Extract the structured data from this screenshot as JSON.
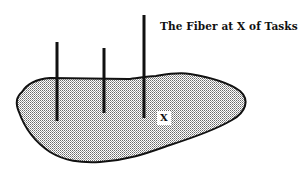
{
  "diagram": {
    "title": "The Fiber at X of Tasks",
    "point_label": "X",
    "colors": {
      "outline": "#111111",
      "fill_dots": "#555555",
      "background": "#ffffff"
    },
    "fibers": [
      {
        "x": 57,
        "y_top": 42,
        "y_bottom": 121
      },
      {
        "x": 104,
        "y_top": 48,
        "y_bottom": 113
      },
      {
        "x": 144,
        "y_top": 15,
        "y_bottom": 118
      }
    ]
  }
}
